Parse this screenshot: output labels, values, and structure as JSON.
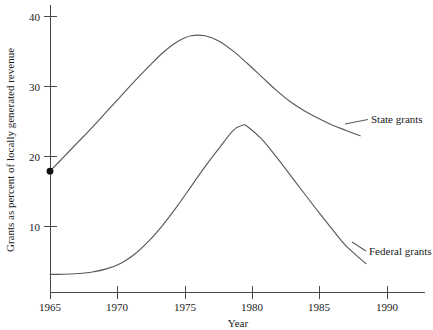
{
  "chart_data": {
    "type": "line",
    "title": "",
    "xlabel": "Year",
    "ylabel": "Grants as percent of locally generated revenue",
    "xlim": [
      1965,
      1991.6
    ],
    "ylim": [
      4.3,
      41.6
    ],
    "xticks": [
      1965,
      1970,
      1975,
      1980,
      1985,
      1990
    ],
    "xticklabels": [
      "1965",
      "1970",
      "1975",
      "1980",
      "1985",
      "1990"
    ],
    "yticks": [
      10,
      20,
      30,
      40
    ],
    "yticklabels": [
      "10",
      "20",
      "30",
      "40"
    ],
    "grid": false,
    "legend_position": "right-inline-labels",
    "annotations": [
      {
        "name": "start-marker",
        "x": 1965,
        "y": 20,
        "style": "filled-dot"
      }
    ],
    "series": [
      {
        "name": "State grants",
        "label": "State grants",
        "color": "#5a5a5a",
        "x": [
          1965,
          1966,
          1967,
          1968,
          1969,
          1970,
          1971,
          1972,
          1973,
          1974,
          1975,
          1976,
          1977,
          1978,
          1979,
          1980,
          1981,
          1982,
          1983,
          1984,
          1985,
          1986,
          1987
        ],
        "y": [
          20.0,
          21.9,
          23.8,
          25.7,
          27.7,
          29.7,
          31.7,
          33.6,
          35.4,
          36.8,
          37.6,
          37.6,
          36.9,
          35.6,
          34.0,
          32.3,
          30.6,
          29.1,
          27.9,
          26.9,
          26.0,
          25.3,
          24.6
        ]
      },
      {
        "name": "Federal grants",
        "label": "Federal grants",
        "color": "#5a5a5a",
        "x": [
          1965,
          1966,
          1967,
          1968,
          1969,
          1970,
          1971,
          1972,
          1973,
          1974,
          1975,
          1976,
          1977,
          1978,
          1978.7,
          1979,
          1980,
          1981,
          1982,
          1983,
          1984,
          1985,
          1986,
          1987.4
        ],
        "y": [
          6.6,
          6.6,
          6.7,
          6.9,
          7.3,
          8.0,
          9.2,
          10.9,
          13.0,
          15.4,
          18.0,
          20.6,
          23.0,
          25.3,
          26.0,
          25.8,
          24.2,
          22.0,
          19.6,
          17.2,
          14.8,
          12.5,
          10.3,
          8.0
        ]
      }
    ]
  },
  "labels": {
    "state_grants": "State grants",
    "federal_grants": "Federal grants",
    "x_axis_title": "Year",
    "y_axis_title": "Grants as percent of locally generated revenue",
    "y_tick_40": "40",
    "y_tick_30": "30",
    "y_tick_20": "20",
    "y_tick_10": "10",
    "x_tick_1965": "1965",
    "x_tick_1970": "1970",
    "x_tick_1975": "1975",
    "x_tick_1980": "1980",
    "x_tick_1985": "1985",
    "x_tick_1990": "1990"
  }
}
